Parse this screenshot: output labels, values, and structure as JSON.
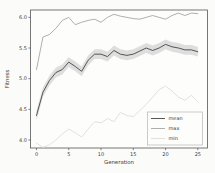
{
  "figure": {
    "background": "#fbfbfa",
    "axes_background": "#fdfdfc",
    "spine_color": "#555555",
    "text_color": "#3c3c3c"
  },
  "chart_data": {
    "type": "line",
    "title": "",
    "xlabel": "Generation",
    "ylabel": "Fitness",
    "x": [
      0,
      1,
      2,
      3,
      4,
      5,
      6,
      7,
      8,
      9,
      10,
      11,
      12,
      13,
      14,
      15,
      16,
      17,
      18,
      19,
      20,
      21,
      22,
      23,
      24,
      25
    ],
    "series": [
      {
        "name": "mean",
        "color": "#454545",
        "band_halfwidth": 0.08,
        "band_color": "#c4c4c4",
        "values": [
          4.4,
          4.78,
          4.97,
          5.1,
          5.15,
          5.27,
          5.2,
          5.12,
          5.3,
          5.4,
          5.4,
          5.36,
          5.46,
          5.4,
          5.38,
          5.4,
          5.45,
          5.5,
          5.46,
          5.5,
          5.56,
          5.52,
          5.5,
          5.47,
          5.47,
          5.44
        ]
      },
      {
        "name": "max",
        "color": "#a6a6a6",
        "values": [
          5.15,
          5.68,
          5.72,
          5.82,
          5.95,
          6.0,
          5.88,
          5.92,
          5.95,
          5.97,
          5.92,
          6.0,
          6.05,
          6.02,
          6.0,
          5.98,
          5.97,
          6.0,
          6.03,
          6.0,
          5.97,
          6.03,
          6.07,
          6.03,
          6.07,
          6.06
        ]
      },
      {
        "name": "min",
        "color": "#dedede",
        "values": [
          3.95,
          3.88,
          3.92,
          4.0,
          4.1,
          4.18,
          4.12,
          4.05,
          4.18,
          4.3,
          4.28,
          4.35,
          4.3,
          4.45,
          4.4,
          4.38,
          4.48,
          4.58,
          4.7,
          4.82,
          4.88,
          4.8,
          4.7,
          4.65,
          4.73,
          4.62
        ]
      }
    ],
    "xlim": [
      -0.93,
      26.5
    ],
    "ylim": [
      3.87,
      6.12
    ],
    "xticks": [
      0,
      5,
      10,
      15,
      20,
      25
    ],
    "yticks": [
      4.0,
      4.5,
      5.0,
      5.5,
      6.0
    ],
    "xtick_labels": [
      "0",
      "5",
      "10",
      "15",
      "20",
      "25"
    ],
    "ytick_labels": [
      "4.0",
      "4.5",
      "5.0",
      "5.5",
      "6.0"
    ],
    "grid": false,
    "legend": {
      "position": "lower right",
      "entries": [
        "mean",
        "max",
        "min"
      ],
      "border_color": "#b5b5b5",
      "background": "#fdfdfc"
    }
  }
}
